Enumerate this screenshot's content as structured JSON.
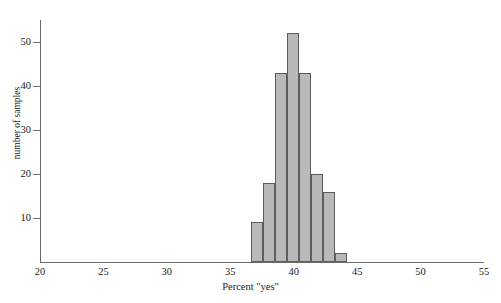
{
  "chart_data": {
    "type": "bar",
    "title": "",
    "subtitle": "",
    "xlabel": "Percent \"yes\"",
    "ylabel": "number of samples",
    "xlim": [
      20,
      55
    ],
    "ylim": [
      0,
      55
    ],
    "xticks": [
      20,
      25,
      30,
      35,
      40,
      45,
      50,
      55
    ],
    "xtick_labels": [
      "20",
      "25",
      "30",
      "35",
      "40",
      "45",
      "50",
      "55"
    ],
    "yticks": [
      10,
      20,
      30,
      40,
      50
    ],
    "ytick_labels": [
      "10",
      "20",
      "30",
      "40",
      "50"
    ],
    "grid": false,
    "legend": null,
    "bin_width": 0.95,
    "bin_edges": [
      36.6,
      37.55,
      38.5,
      39.45,
      40.4,
      41.35,
      42.3,
      43.25,
      44.2
    ],
    "bin_centers": [
      37.1,
      38.0,
      39.0,
      39.9,
      40.9,
      41.8,
      42.8,
      43.7
    ],
    "categories": [
      "36.6-37.6",
      "37.6-38.5",
      "38.5-39.5",
      "39.5-40.4",
      "40.4-41.4",
      "41.4-42.3",
      "42.3-43.3",
      "43.3-44.2"
    ],
    "values": [
      9,
      18,
      43,
      52,
      43,
      20,
      16,
      2
    ],
    "bar_fill_color": "#b9b9b9",
    "bar_edge_color": "#5d5d5d",
    "axis_color": "#6b6b6b"
  },
  "axes": {
    "x_title": "Percent \"yes\"",
    "y_title": "number of samples"
  }
}
